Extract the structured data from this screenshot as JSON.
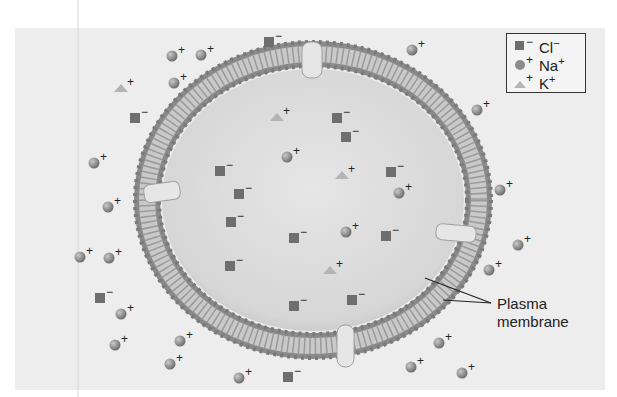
{
  "figure": {
    "type": "cell-membrane-ion-diagram",
    "colors": {
      "background_panel": "#ededed",
      "cell_interior": "#dcdcdc",
      "membrane_dark": "#8a8a8a",
      "membrane_light": "#c8c8c8",
      "channel": "#e4e4e4",
      "chloride": "#6e6e6e",
      "sodium": "#8c8c8c",
      "potassium": "#b4b4b4"
    }
  },
  "legend": {
    "items": [
      {
        "symbol": "square",
        "charge": "−",
        "ion": "Cl",
        "ion_charge": "−"
      },
      {
        "symbol": "sphere",
        "charge": "+",
        "ion": "Na",
        "ion_charge": "+"
      },
      {
        "symbol": "triangle",
        "charge": "+",
        "ion": "K",
        "ion_charge": "+"
      }
    ]
  },
  "callout": {
    "line1": "Plasma",
    "line2": "membrane"
  },
  "ions": {
    "outside": [
      {
        "type": "Na",
        "x": 172,
        "y": 56
      },
      {
        "type": "Na",
        "x": 201,
        "y": 55
      },
      {
        "type": "Cl",
        "x": 269,
        "y": 42
      },
      {
        "type": "K",
        "x": 121,
        "y": 88
      },
      {
        "type": "Na",
        "x": 174,
        "y": 83
      },
      {
        "type": "Cl",
        "x": 135,
        "y": 118
      },
      {
        "type": "Na",
        "x": 94,
        "y": 163
      },
      {
        "type": "Na",
        "x": 108,
        "y": 207
      },
      {
        "type": "Na",
        "x": 80,
        "y": 257
      },
      {
        "type": "Na",
        "x": 109,
        "y": 258
      },
      {
        "type": "Cl",
        "x": 100,
        "y": 298
      },
      {
        "type": "Na",
        "x": 121,
        "y": 314
      },
      {
        "type": "Na",
        "x": 115,
        "y": 345
      },
      {
        "type": "Na",
        "x": 180,
        "y": 341
      },
      {
        "type": "Na",
        "x": 170,
        "y": 364
      },
      {
        "type": "Na",
        "x": 239,
        "y": 378
      },
      {
        "type": "Cl",
        "x": 288,
        "y": 377
      },
      {
        "type": "Na",
        "x": 412,
        "y": 50
      },
      {
        "type": "Na",
        "x": 477,
        "y": 110
      },
      {
        "type": "Na",
        "x": 500,
        "y": 190
      },
      {
        "type": "Na",
        "x": 518,
        "y": 245
      },
      {
        "type": "Na",
        "x": 489,
        "y": 270
      },
      {
        "type": "Na",
        "x": 439,
        "y": 343
      },
      {
        "type": "Na",
        "x": 411,
        "y": 367
      },
      {
        "type": "Na",
        "x": 462,
        "y": 373
      }
    ],
    "inside": [
      {
        "type": "K",
        "x": 277,
        "y": 117
      },
      {
        "type": "Cl",
        "x": 337,
        "y": 118
      },
      {
        "type": "Cl",
        "x": 346,
        "y": 137
      },
      {
        "type": "Na",
        "x": 287,
        "y": 157
      },
      {
        "type": "Cl",
        "x": 220,
        "y": 171
      },
      {
        "type": "K",
        "x": 342,
        "y": 175
      },
      {
        "type": "Cl",
        "x": 391,
        "y": 172
      },
      {
        "type": "Cl",
        "x": 239,
        "y": 194
      },
      {
        "type": "Na",
        "x": 399,
        "y": 193
      },
      {
        "type": "Cl",
        "x": 231,
        "y": 222
      },
      {
        "type": "Na",
        "x": 346,
        "y": 232
      },
      {
        "type": "Cl",
        "x": 294,
        "y": 238
      },
      {
        "type": "Cl",
        "x": 386,
        "y": 236
      },
      {
        "type": "Cl",
        "x": 230,
        "y": 266
      },
      {
        "type": "K",
        "x": 330,
        "y": 270
      },
      {
        "type": "Cl",
        "x": 294,
        "y": 306
      },
      {
        "type": "Cl",
        "x": 352,
        "y": 300
      }
    ]
  }
}
